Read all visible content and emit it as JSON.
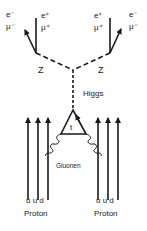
{
  "diagram": {
    "type": "feynman",
    "colors": {
      "line": "#1a1a1a",
      "text": "#333333",
      "background": "#ffffff"
    },
    "left_leptons": {
      "outgoing_arrow_label_top": "e⁻",
      "outgoing_arrow_label_bottom": "μ⁻",
      "straight_label_top": "e⁺",
      "straight_label_bottom": "μ⁺"
    },
    "right_leptons": {
      "straight_label_top": "e⁺",
      "straight_label_bottom": "μ⁺",
      "outgoing_arrow_label_top": "e⁻",
      "outgoing_arrow_label_bottom": "μ⁻"
    },
    "left_boson": "Z",
    "right_boson": "Z",
    "higgs_label": "Higgs",
    "top_loop_label": "t",
    "gluon_label": "Gluonen",
    "left_proton": {
      "quarks": "u u d",
      "label": "Proton"
    },
    "right_proton": {
      "quarks": "u u d",
      "label": "Proton"
    }
  }
}
